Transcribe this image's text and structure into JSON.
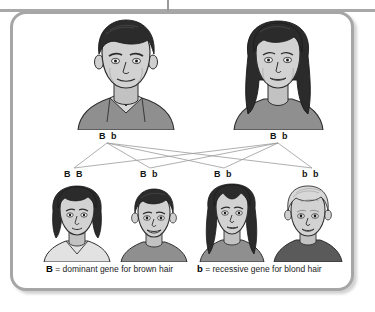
{
  "diagram": {
    "frame_color": "#a6a6a6",
    "background": "#ffffff"
  },
  "parents": [
    {
      "id": "father",
      "role": "father",
      "genotype": "B b",
      "hair": "brown",
      "description": "adult male with short dark brown hair and grey collared shirt"
    },
    {
      "id": "mother",
      "role": "mother",
      "genotype": "B b",
      "hair": "brown",
      "description": "adult female with long dark brown hair and grey top"
    }
  ],
  "offspring": [
    {
      "id": "child-1",
      "genotype": "B B",
      "hair": "brown",
      "description": "girl with dark brown bob hair and light shirt"
    },
    {
      "id": "child-2",
      "genotype": "B b",
      "hair": "brown",
      "description": "boy with short dark brown hair and grey shirt"
    },
    {
      "id": "child-3",
      "genotype": "B b",
      "hair": "brown",
      "description": "girl with long dark brown hair and grey top"
    },
    {
      "id": "child-4",
      "genotype": "b b",
      "hair": "blond",
      "description": "boy with blond hair and dark shirt"
    }
  ],
  "legend": [
    {
      "symbol": "B",
      "text": " = dominant gene for brown hair"
    },
    {
      "symbol": "b",
      "text": " = recessive gene for blond hair"
    }
  ],
  "colors": {
    "hair_dark": "#2b2b2b",
    "hair_blond": "#d8d8d8",
    "skin": "#d2d2d2",
    "shirt_grey": "#8f8f8f",
    "shirt_light": "#e2e2e2",
    "shirt_dark": "#5a5a5a",
    "outline": "#2f2f2f",
    "line": "#9b9b9b"
  }
}
